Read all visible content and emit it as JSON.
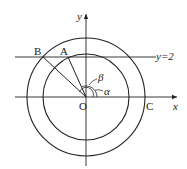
{
  "diagram": {
    "type": "geometry",
    "colors": {
      "stroke": "#222222",
      "background": "#ffffff"
    },
    "axes": {
      "x_label": "x",
      "y_label": "y"
    },
    "line_label": "y=2",
    "points": {
      "origin": "O",
      "A": "A",
      "B": "B",
      "C": "C"
    },
    "angles": {
      "alpha": "α",
      "beta": "β"
    },
    "circles": [
      {
        "name": "outer",
        "passes_through": [
          "B",
          "C"
        ]
      },
      {
        "name": "inner",
        "passes_through": [
          "A"
        ]
      }
    ]
  }
}
